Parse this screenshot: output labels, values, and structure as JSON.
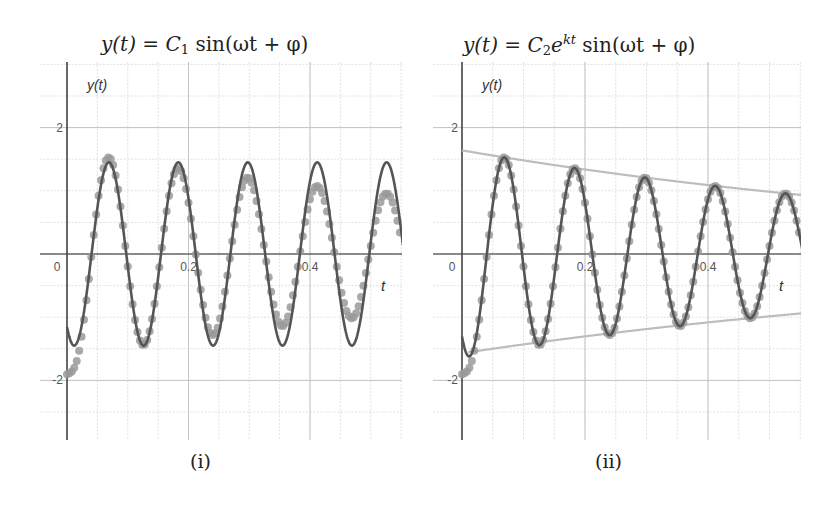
{
  "figure": {
    "panels": [
      {
        "id": "i",
        "title_parts": {
          "lhs": "y(t)",
          "eq": " = ",
          "coef": "C",
          "coef_sub": "1",
          "exp": "",
          "rest": " sin(ωt + φ)"
        },
        "title": "y(t) = C1 sin(ωt + φ)",
        "caption": "(i)",
        "y_axis_label": "y(t)",
        "x_axis_label": "t"
      },
      {
        "id": "ii",
        "title_parts": {
          "lhs": "y(t)",
          "eq": " = ",
          "coef": "C",
          "coef_sub": "2",
          "exp": "kt",
          "rest": " sin(ωt + φ)"
        },
        "title": "y(t) = C2 e^{kt} sin(ωt + φ)",
        "caption": "(ii)",
        "y_axis_label": "y(t)",
        "x_axis_label": "t"
      }
    ]
  },
  "chart_data": [
    {
      "type": "scatter",
      "title": "y(t) = C1 sin(ωt + φ)",
      "caption": "(i)",
      "xlabel": "t",
      "ylabel": "y(t)",
      "xlim": [
        0,
        0.552
      ],
      "ylim": [
        -2.95,
        3.05
      ],
      "x_ticks": [
        {
          "value": 0,
          "label": "0"
        },
        {
          "value": 0.2,
          "label": "0.2"
        },
        {
          "value": 0.4,
          "label": "0.4"
        }
      ],
      "y_ticks": [
        {
          "value": 2,
          "label": "2"
        },
        {
          "value": -2,
          "label": "-2"
        }
      ],
      "grid": {
        "on": true,
        "x_step": 0.05,
        "y_step": 0.5
      },
      "series": [
        {
          "name": "measured data",
          "kind": "points",
          "color": "#9a9a9a",
          "model": {
            "form": "C*exp(k*t)*sin(w*t+phi) + T*exp(-t/tau)",
            "C": 1.64,
            "k": -1.02,
            "w": 54.97,
            "phi": -2.222,
            "T": -0.6,
            "tau": 0.01,
            "dt": 0.004
          },
          "observed_peaks": [
            {
              "t": 0.069,
              "y": 1.46
            },
            {
              "t": 0.182,
              "y": 1.33
            },
            {
              "t": 0.298,
              "y": 1.16
            },
            {
              "t": 0.412,
              "y": 1.0
            },
            {
              "t": 0.527,
              "y": 0.87
            }
          ],
          "observed_troughs": [
            {
              "t": 0.0,
              "y": -1.9
            },
            {
              "t": 0.126,
              "y": -1.42
            },
            {
              "t": 0.24,
              "y": -1.2
            },
            {
              "t": 0.355,
              "y": -1.03
            },
            {
              "t": 0.47,
              "y": -0.88
            }
          ]
        },
        {
          "name": "fit: C1 sin(ωt + φ)",
          "kind": "line",
          "color": "#555555",
          "model": {
            "form": "C*sin(w*t+phi)",
            "C": 1.45,
            "k": 0,
            "w": 54.97,
            "phi": -2.222
          },
          "observed_peaks": [
            {
              "t": 0.069,
              "y": 1.46
            },
            {
              "t": 0.181,
              "y": 1.46
            },
            {
              "t": 0.298,
              "y": 1.46
            },
            {
              "t": 0.412,
              "y": 1.46
            },
            {
              "t": 0.527,
              "y": 1.46
            }
          ],
          "observed_troughs": [
            {
              "t": 0.012,
              "y": -1.43
            },
            {
              "t": 0.126,
              "y": -1.43
            },
            {
              "t": 0.24,
              "y": -1.43
            },
            {
              "t": 0.355,
              "y": -1.43
            },
            {
              "t": 0.47,
              "y": -1.43
            }
          ]
        }
      ]
    },
    {
      "type": "scatter",
      "title": "y(t) = C2 e^{kt} sin(ωt + φ)",
      "caption": "(ii)",
      "xlabel": "t",
      "ylabel": "y(t)",
      "xlim": [
        0,
        0.551
      ],
      "ylim": [
        -2.95,
        3.05
      ],
      "x_ticks": [
        {
          "value": 0,
          "label": "0"
        },
        {
          "value": 0.2,
          "label": "0.2"
        },
        {
          "value": 0.4,
          "label": "0.4"
        }
      ],
      "y_ticks": [
        {
          "value": 2,
          "label": "2"
        },
        {
          "value": -2,
          "label": "-2"
        }
      ],
      "grid": {
        "on": true,
        "x_step": 0.05,
        "y_step": 0.5
      },
      "series": [
        {
          "name": "measured data",
          "kind": "points",
          "color": "#9a9a9a",
          "model": {
            "form": "C*exp(k*t)*sin(w*t+phi) + T*exp(-t/tau)",
            "C": 1.64,
            "k": -1.02,
            "w": 54.97,
            "phi": -2.222,
            "T": -0.6,
            "tau": 0.01,
            "dt": 0.004
          }
        },
        {
          "name": "fit: C2 e^{kt} sin(ωt + φ)",
          "kind": "line",
          "color": "#555555",
          "model": {
            "form": "C*exp(k*t)*sin(w*t+phi)",
            "C": 1.64,
            "k": -1.02,
            "w": 54.97,
            "phi": -2.222
          },
          "observed_peaks": [
            {
              "t": 0.07,
              "y": 1.49
            },
            {
              "t": 0.185,
              "y": 1.34
            },
            {
              "t": 0.296,
              "y": 1.19
            },
            {
              "t": 0.41,
              "y": 1.06
            },
            {
              "t": 0.525,
              "y": 0.94
            }
          ]
        },
        {
          "name": "upper envelope: C2 e^{kt}",
          "kind": "line",
          "color": "#bdbdbd",
          "model": {
            "form": "C*exp(k*t)",
            "C": 1.64,
            "k": -1.02
          },
          "endpoints": [
            {
              "t": 0,
              "y": 1.64
            },
            {
              "t": 0.551,
              "y": 0.935
            }
          ]
        },
        {
          "name": "lower envelope: -C2 e^{kt}",
          "kind": "line",
          "color": "#bdbdbd",
          "model": {
            "form": "-C*exp(k*t)",
            "C": 1.57,
            "k": -0.93
          },
          "endpoints": [
            {
              "t": 0.01,
              "y": -1.57
            },
            {
              "t": 0.551,
              "y": -0.94
            }
          ]
        }
      ]
    }
  ],
  "layout": {
    "panels": [
      {
        "x0": 67,
        "xScale": 607.5,
        "y0": 254,
        "yScale": 63.2,
        "left": 40,
        "right": 402,
        "top": 62,
        "bottom": 440,
        "title_x": 101,
        "caption_x": 206,
        "tlabel_x": 383,
        "tlabel_y": 291
      },
      {
        "x0": 462,
        "xScale": 615,
        "y0": 254,
        "yScale": 63.2,
        "left": 433,
        "right": 801,
        "top": 62,
        "bottom": 440,
        "title_x": 463,
        "caption_x": 600,
        "tlabel_x": 781,
        "tlabel_y": 291
      }
    ]
  }
}
